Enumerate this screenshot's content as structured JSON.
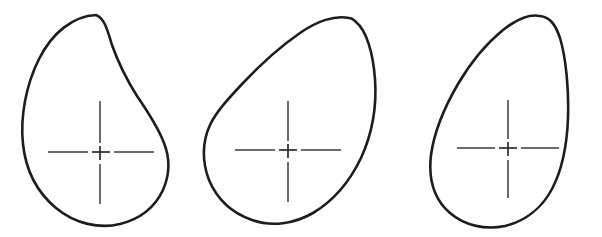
{
  "figure": {
    "title": "Egg outline shapes with centroid centerlines",
    "background_color": "#ffffff",
    "outline_color": "#1d1d1d",
    "centerline_color": "#3a3a3a",
    "width": 602,
    "height": 237,
    "shape_count": 3,
    "shapes": [
      {
        "id": "shape-1",
        "label": "Egg outline 1",
        "description": "Broad ovoid, apex upper-left, rounded large end at bottom",
        "center_x": 100,
        "center_y": 152,
        "crosshair": {
          "h_left_dash": [
            48,
            88
          ],
          "h_center_dash": [
            92,
            110
          ],
          "h_right_dash": [
            114,
            154
          ],
          "v_top_dash": [
            101,
            143
          ],
          "v_center_dash": [
            146,
            160
          ],
          "v_bottom_dash": [
            164,
            204
          ]
        },
        "path": "M 96 15 C 73 16 52 33 39 59 C 26 85 20 117 23 144 C 26 173 38 193 56 208 C 75 224 100 229 120 224 C 140 219 155 207 163 190 C 170 174 170 158 164 143 C 158 127 148 112 137 96 C 125 77 118 62 112 45 C 107 28 104 18 96 15 Z"
      },
      {
        "id": "shape-2",
        "label": "Egg outline 2",
        "description": "Tilted ovoid, apex upper-right, straight upper-left flank",
        "center_x": 288,
        "center_y": 150,
        "crosshair": {
          "h_left_dash": [
            235,
            275
          ],
          "h_center_dash": [
            279,
            297
          ],
          "h_right_dash": [
            301,
            341
          ],
          "v_top_dash": [
            101,
            141
          ],
          "v_center_dash": [
            144,
            158
          ],
          "v_bottom_dash": [
            162,
            202
          ]
        },
        "path": "M 349 18 C 335 15 317 21 300 33 C 281 46 261 64 243 83 C 228 99 216 112 210 125 C 202 142 202 162 209 180 C 217 199 232 213 252 220 C 272 227 294 224 313 213 C 333 201 350 181 361 158 C 372 134 377 107 375 79 C 373 52 366 30 356 22 C 353 19 351 18 349 18 Z"
      },
      {
        "id": "shape-3",
        "label": "Egg outline 3",
        "description": "Narrow ovoid, peaked apex at top, rounded base",
        "center_x": 508,
        "center_y": 148,
        "crosshair": {
          "h_left_dash": [
            457,
            495
          ],
          "h_center_dash": [
            499,
            517
          ],
          "h_right_dash": [
            521,
            559
          ],
          "v_top_dash": [
            100,
            139
          ],
          "v_center_dash": [
            142,
            156
          ],
          "v_bottom_dash": [
            160,
            198
          ]
        },
        "path": "M 540 16 C 530 14 517 19 503 30 C 487 43 471 62 458 84 C 444 108 434 133 431 155 C 428 180 435 200 450 213 C 465 226 486 230 505 226 C 525 221 542 208 552 189 C 562 170 567 145 568 118 C 569 90 566 58 560 38 C 555 23 549 17 540 16 Z"
      }
    ]
  }
}
